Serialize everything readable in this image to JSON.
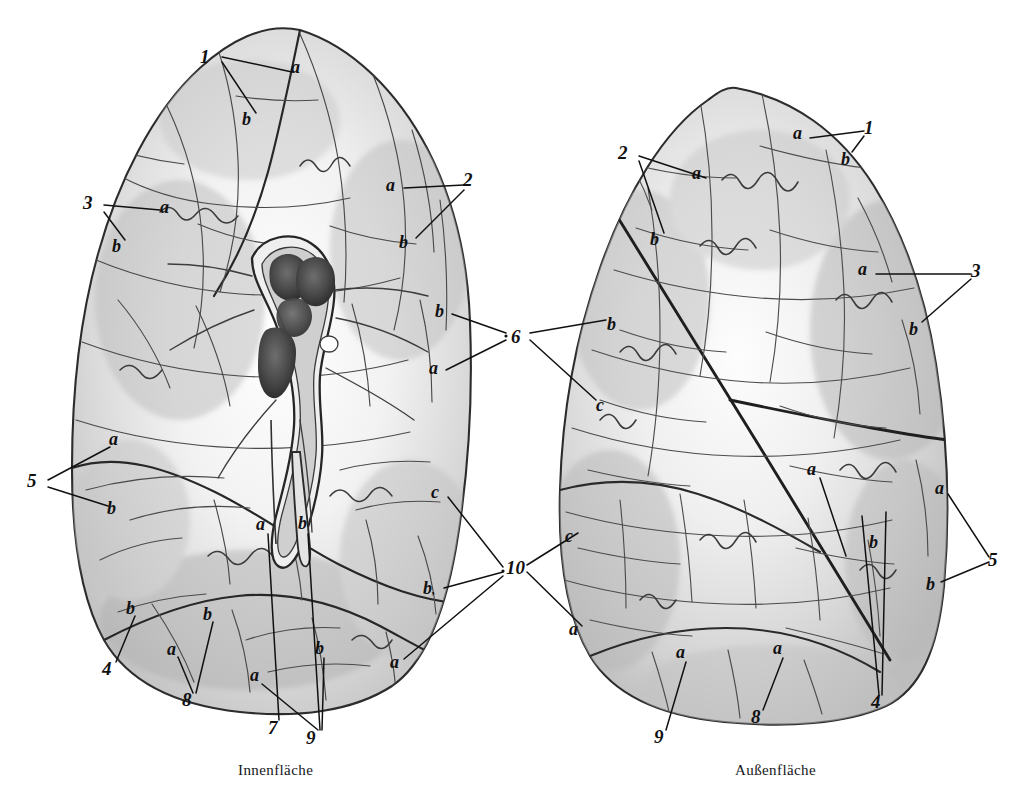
{
  "figure": {
    "title_left": "Innenfläche",
    "title_right": "Außenfläche",
    "ink": "#2b2b2b",
    "paper": "#ffffff",
    "shade": "#8d8d8d"
  },
  "captions": {
    "left": "Innenfläche",
    "right": "Außenfläche"
  },
  "left_lung": {
    "name": "innenflaeche-lung",
    "labels": [
      {
        "text": "1",
        "x": 205,
        "y": 57,
        "kind": "num"
      },
      {
        "text": "a",
        "x": 296,
        "y": 68,
        "kind": "let"
      },
      {
        "text": "b",
        "x": 247,
        "y": 120,
        "kind": "let"
      },
      {
        "text": "3",
        "x": 88,
        "y": 203,
        "kind": "num"
      },
      {
        "text": "a",
        "x": 165,
        "y": 208,
        "kind": "let"
      },
      {
        "text": "b",
        "x": 117,
        "y": 247,
        "kind": "let"
      },
      {
        "text": "2",
        "x": 468,
        "y": 180,
        "kind": "num"
      },
      {
        "text": "a",
        "x": 391,
        "y": 186,
        "kind": "let"
      },
      {
        "text": "b",
        "x": 404,
        "y": 243,
        "kind": "let"
      },
      {
        "text": "b",
        "x": 440,
        "y": 312,
        "kind": "let"
      },
      {
        "text": "a",
        "x": 434,
        "y": 369,
        "kind": "let"
      },
      {
        "text": "a",
        "x": 114,
        "y": 440,
        "kind": "let"
      },
      {
        "text": "5",
        "x": 32,
        "y": 481,
        "kind": "num"
      },
      {
        "text": "b",
        "x": 112,
        "y": 509,
        "kind": "let"
      },
      {
        "text": "c",
        "x": 436,
        "y": 493,
        "kind": "let"
      },
      {
        "text": "b",
        "x": 428,
        "y": 589,
        "kind": "sub"
      },
      {
        "text": "a",
        "x": 395,
        "y": 663,
        "kind": "let"
      },
      {
        "text": "a",
        "x": 261,
        "y": 525,
        "kind": "let"
      },
      {
        "text": "b",
        "x": 303,
        "y": 524,
        "kind": "let"
      },
      {
        "text": "4",
        "x": 107,
        "y": 669,
        "kind": "num"
      },
      {
        "text": "b",
        "x": 131,
        "y": 609,
        "kind": "let"
      },
      {
        "text": "a",
        "x": 172,
        "y": 650,
        "kind": "let"
      },
      {
        "text": "b",
        "x": 208,
        "y": 615,
        "kind": "let"
      },
      {
        "text": "8",
        "x": 187,
        "y": 700,
        "kind": "num"
      },
      {
        "text": "a",
        "x": 255,
        "y": 676,
        "kind": "let"
      },
      {
        "text": "7",
        "x": 273,
        "y": 728,
        "kind": "num"
      },
      {
        "text": "b",
        "x": 320,
        "y": 649,
        "kind": "let"
      },
      {
        "text": "9",
        "x": 311,
        "y": 738,
        "kind": "num"
      }
    ]
  },
  "right_lung": {
    "name": "aussenflaeche-lung",
    "labels": [
      {
        "text": "1",
        "x": 869,
        "y": 128,
        "kind": "num"
      },
      {
        "text": "a",
        "x": 798,
        "y": 134,
        "kind": "let"
      },
      {
        "text": "b",
        "x": 846,
        "y": 160,
        "kind": "let"
      },
      {
        "text": "2",
        "x": 623,
        "y": 153,
        "kind": "num"
      },
      {
        "text": "a",
        "x": 697,
        "y": 174,
        "kind": "let"
      },
      {
        "text": "b",
        "x": 655,
        "y": 240,
        "kind": "let"
      },
      {
        "text": "3",
        "x": 976,
        "y": 271,
        "kind": "num"
      },
      {
        "text": "a",
        "x": 863,
        "y": 270,
        "kind": "let"
      },
      {
        "text": "b",
        "x": 914,
        "y": 330,
        "kind": "let"
      },
      {
        "text": "6",
        "x": 516,
        "y": 337,
        "kind": "num"
      },
      {
        "text": "b",
        "x": 612,
        "y": 325,
        "kind": "let"
      },
      {
        "text": "c",
        "x": 601,
        "y": 406,
        "kind": "let"
      },
      {
        "text": "c",
        "x": 570,
        "y": 537,
        "kind": "let"
      },
      {
        "text": "a",
        "x": 574,
        "y": 630,
        "kind": "let"
      },
      {
        "text": "10",
        "x": 511,
        "y": 568,
        "kind": "num"
      },
      {
        "text": "a",
        "x": 812,
        "y": 470,
        "kind": "let"
      },
      {
        "text": "a",
        "x": 940,
        "y": 489,
        "kind": "let"
      },
      {
        "text": "5",
        "x": 993,
        "y": 560,
        "kind": "num"
      },
      {
        "text": "b",
        "x": 931,
        "y": 585,
        "kind": "let"
      },
      {
        "text": "b",
        "x": 874,
        "y": 543,
        "kind": "let"
      },
      {
        "text": "a",
        "x": 681,
        "y": 653,
        "kind": "let"
      },
      {
        "text": "9",
        "x": 659,
        "y": 737,
        "kind": "num"
      },
      {
        "text": "a",
        "x": 778,
        "y": 649,
        "kind": "let"
      },
      {
        "text": "8",
        "x": 756,
        "y": 717,
        "kind": "num"
      },
      {
        "text": "4",
        "x": 876,
        "y": 702,
        "kind": "num"
      }
    ]
  },
  "chart_data": {
    "type": "diagram",
    "annotations": [
      "1",
      "2",
      "3",
      "4",
      "5",
      "6",
      "7",
      "8",
      "9",
      "10",
      "a",
      "b",
      "c",
      "b,"
    ]
  }
}
